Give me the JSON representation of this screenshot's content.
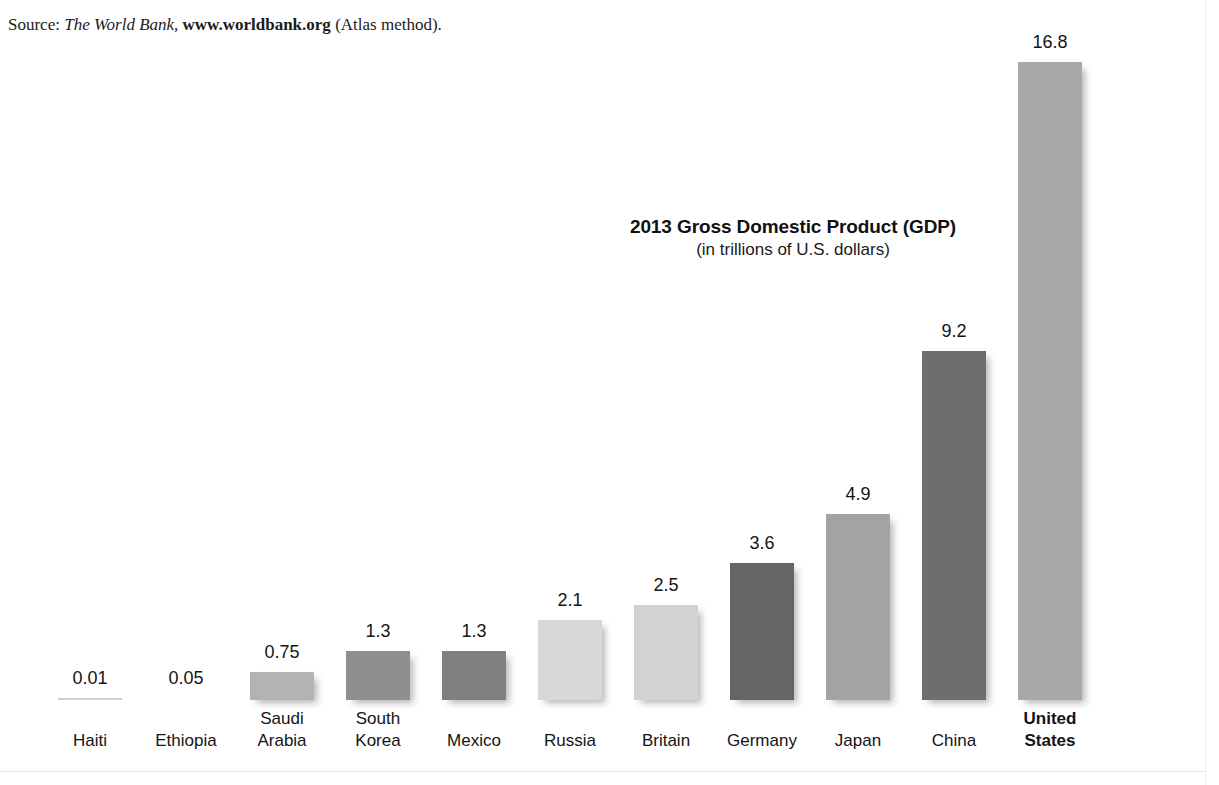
{
  "source": {
    "prefix": "Source: ",
    "publication": "The World Bank,",
    "url": "www.worldbank.org",
    "suffix": " (Atlas method)."
  },
  "title": "2013 Gross Domestic Product (GDP)",
  "subtitle": "(in trillions of U.S. dollars)",
  "chart_data": {
    "type": "bar",
    "title": "2013 Gross Domestic Product (GDP)",
    "subtitle": "(in trillions of U.S. dollars)",
    "xlabel": "",
    "ylabel": "Trillions of U.S. dollars",
    "ylim": [
      0,
      16.8
    ],
    "grid": false,
    "legend": false,
    "units": "trillions of U.S. dollars",
    "year": 2013,
    "categories": [
      "Haiti",
      "Ethiopia",
      "Saudi Arabia",
      "South Korea",
      "Mexico",
      "Russia",
      "Britain",
      "Germany",
      "Japan",
      "China",
      "United States"
    ],
    "values": [
      0.01,
      0.05,
      0.75,
      1.3,
      1.3,
      2.1,
      2.5,
      3.6,
      4.9,
      9.2,
      16.8
    ],
    "value_labels": [
      "0.01",
      "0.05",
      "0.75",
      "1.3",
      "1.3",
      "2.1",
      "2.5",
      "3.6",
      "4.9",
      "9.2",
      "16.8"
    ],
    "bar_colors": [
      "#cfcfcf",
      "#ffffff",
      "#b3b3b3",
      "#8f8f8f",
      "#808080",
      "#d8d8d8",
      "#d2d2d2",
      "#656565",
      "#a3a3a3",
      "#6e6e6e",
      "#a8a8a8"
    ],
    "emphasis_category": "United States"
  },
  "bars": [
    {
      "label_line1": "Haiti",
      "label_line2": "",
      "value": "0.01",
      "color": "#cfcfcf",
      "bold": false
    },
    {
      "label_line1": "Ethiopia",
      "label_line2": "",
      "value": "0.05",
      "color": "#ffffff",
      "bold": false
    },
    {
      "label_line1": "Saudi",
      "label_line2": "Arabia",
      "value": "0.75",
      "color": "#b3b3b3",
      "bold": false
    },
    {
      "label_line1": "South",
      "label_line2": "Korea",
      "value": "1.3",
      "color": "#8f8f8f",
      "bold": false
    },
    {
      "label_line1": "Mexico",
      "label_line2": "",
      "value": "1.3",
      "color": "#808080",
      "bold": false
    },
    {
      "label_line1": "Russia",
      "label_line2": "",
      "value": "2.1",
      "color": "#d8d8d8",
      "bold": false
    },
    {
      "label_line1": "Britain",
      "label_line2": "",
      "value": "2.5",
      "color": "#d2d2d2",
      "bold": false
    },
    {
      "label_line1": "Germany",
      "label_line2": "",
      "value": "3.6",
      "color": "#656565",
      "bold": false
    },
    {
      "label_line1": "Japan",
      "label_line2": "",
      "value": "4.9",
      "color": "#a3a3a3",
      "bold": false
    },
    {
      "label_line1": "China",
      "label_line2": "",
      "value": "9.2",
      "color": "#6e6e6e",
      "bold": false
    },
    {
      "label_line1": "United",
      "label_line2": "States",
      "value": "16.8",
      "color": "#a8a8a8",
      "bold": true
    }
  ]
}
